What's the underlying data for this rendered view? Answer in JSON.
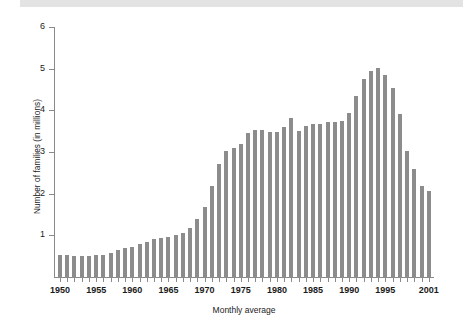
{
  "figure": {
    "background_color": "#ffffff",
    "bar_color": "#8c8c8c",
    "axis_color": "#8a8a8a",
    "text_color": "#1b1b1b",
    "band_color": "#e3e3e3"
  },
  "chart_data": {
    "type": "bar",
    "title": "",
    "subtitle": "",
    "xlabel": "Monthly average",
    "ylabel": "Number of families (in millions)",
    "xlim": [
      1949.4,
      2001.0
    ],
    "ylim": [
      0,
      6
    ],
    "ytick_labels": [
      "1",
      "2",
      "3",
      "4",
      "5",
      "6"
    ],
    "ytick_values": [
      1,
      2,
      3,
      4,
      5,
      6
    ],
    "xtick_labels": [
      "1950",
      "1955",
      "1960",
      "1965",
      "1970",
      "1975",
      "1980",
      "1985",
      "1990",
      "1995",
      "2001"
    ],
    "xtick_values": [
      1950,
      1955,
      1960,
      1965,
      1970,
      1975,
      1980,
      1985,
      1990,
      1995,
      2001
    ],
    "minor_xticks": true,
    "grid": false,
    "legend": false,
    "categories": [
      "1950",
      "1951",
      "1952",
      "1953",
      "1954",
      "1955",
      "1956",
      "1957",
      "1958",
      "1959",
      "1960",
      "1961",
      "1962",
      "1963",
      "1964",
      "1965",
      "1966",
      "1967",
      "1968",
      "1969",
      "1970",
      "1971",
      "1972",
      "1973",
      "1974",
      "1975",
      "1976",
      "1977",
      "1978",
      "1979",
      "1980",
      "1981",
      "1982",
      "1983",
      "1984",
      "1985",
      "1986",
      "1987",
      "1988",
      "1989",
      "1990",
      "1991",
      "1992",
      "1993",
      "1994",
      "1995",
      "1996",
      "1997",
      "1998",
      "1999",
      "2000"
    ],
    "values": [
      0.56,
      0.56,
      0.52,
      0.52,
      0.54,
      0.56,
      0.56,
      0.6,
      0.67,
      0.72,
      0.75,
      0.82,
      0.87,
      0.93,
      0.95,
      0.99,
      1.04,
      1.08,
      1.2,
      1.41,
      1.7,
      2.21,
      2.73,
      3.04,
      3.13,
      3.21,
      3.48,
      3.56,
      3.56,
      3.51,
      3.5,
      3.63,
      3.83,
      3.53,
      3.66,
      3.69,
      3.7,
      3.75,
      3.75,
      3.77,
      3.96,
      4.37,
      4.77,
      4.98,
      5.03,
      4.87,
      4.55,
      3.93,
      3.06,
      2.61,
      2.21
    ],
    "extra_bar_note": "final short bar at right edge",
    "final_bar_value": 2.09
  },
  "axes": {
    "y_title": "Number of families (in millions)",
    "x_title": "Monthly average"
  }
}
